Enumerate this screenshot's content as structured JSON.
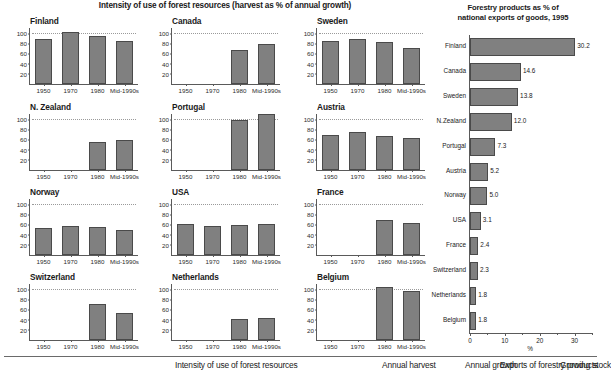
{
  "main": {
    "title": "Intensity of use of forest resources (harvest as % of annual growth)"
  },
  "right": {
    "title_line1": "Forestry products as % of",
    "title_line2": "national exports of goods, 1995",
    "x_axis_title": "%"
  },
  "legend": {
    "items": [
      "Intensity of use of forest resources",
      "Annual harvest",
      "Annual growth",
      "Growing stock",
      "Exports of forestry products"
    ]
  },
  "chart_data": [
    {
      "type": "bar",
      "title": "Intensity of use of forest resources (harvest as % of annual growth)",
      "xlabel": "",
      "ylabel": "",
      "ylim": [
        0,
        110
      ],
      "yticks": [
        20,
        40,
        60,
        80,
        100
      ],
      "categories": [
        "1950",
        "1970",
        "1980",
        "Mid-1990s"
      ],
      "reference_line": 100,
      "grid": false,
      "panels": [
        {
          "name": "Finland",
          "values": [
            89,
            102,
            94,
            85
          ]
        },
        {
          "name": "Canada",
          "values": [
            null,
            null,
            67,
            78
          ]
        },
        {
          "name": "Sweden",
          "values": [
            84,
            88,
            82,
            70
          ]
        },
        {
          "name": "N. Zealand",
          "values": [
            null,
            null,
            56,
            58
          ]
        },
        {
          "name": "Portugal",
          "values": [
            null,
            null,
            99,
            110
          ]
        },
        {
          "name": "Austria",
          "values": [
            69,
            74,
            67,
            62
          ]
        },
        {
          "name": "Norway",
          "values": [
            54,
            57,
            56,
            49
          ]
        },
        {
          "name": "USA",
          "values": [
            61,
            57,
            58,
            61
          ]
        },
        {
          "name": "France",
          "values": [
            null,
            null,
            68,
            62
          ]
        },
        {
          "name": "Switzerland",
          "values": [
            null,
            null,
            71,
            54
          ]
        },
        {
          "name": "Netherlands",
          "values": [
            null,
            null,
            41,
            43
          ]
        },
        {
          "name": "Belgium",
          "values": [
            null,
            null,
            104,
            96
          ]
        }
      ]
    },
    {
      "type": "bar",
      "orientation": "horizontal",
      "title": "Forestry products as % of national exports of goods, 1995",
      "xlabel": "%",
      "ylabel": "",
      "xlim": [
        0,
        35
      ],
      "xticks": [
        0,
        10,
        20,
        30
      ],
      "xticks_minor": [
        5,
        15,
        25,
        35
      ],
      "grid": false,
      "categories": [
        "Finland",
        "Canada",
        "Sweden",
        "N.Zealand",
        "Portugal",
        "Austria",
        "Norway",
        "USA",
        "France",
        "Switzerland",
        "Netherlands",
        "Belgium"
      ],
      "values": [
        30.2,
        14.6,
        13.8,
        12.0,
        7.3,
        5.2,
        5.0,
        3.1,
        2.4,
        2.3,
        1.8,
        1.8
      ],
      "value_labels": [
        "30.2",
        "14.6",
        "13.8",
        "12.0",
        "7.3",
        "5.2",
        "5.0",
        "3.1",
        "2.4",
        "2.3",
        "1.8",
        "1.8"
      ]
    }
  ],
  "colors": {
    "bar_fill": "#808080",
    "bar_stroke": "#4a4a4a",
    "axis": "#5a5a5a",
    "reference_line": "#9a9a9a",
    "text": "#1a1a1a"
  }
}
